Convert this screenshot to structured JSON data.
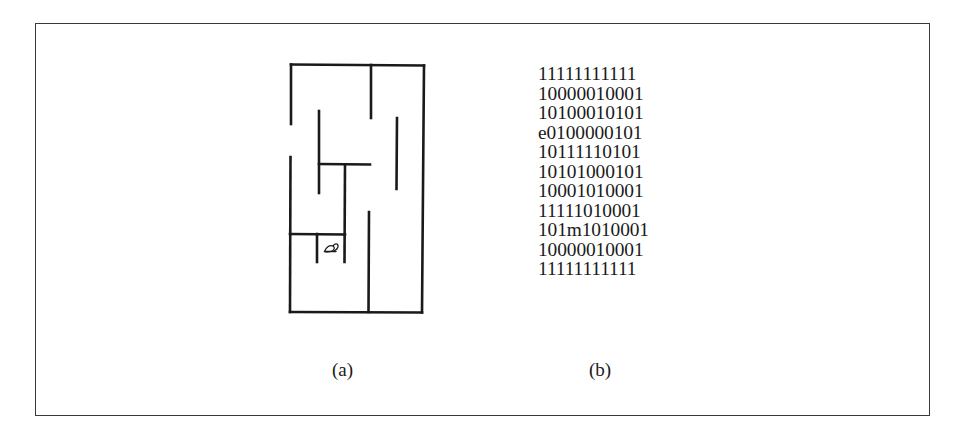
{
  "figure": {
    "panel_a": {
      "caption": "(a)",
      "description": "Maze drawing with a mouse glyph in an enclosed cell",
      "mouse_glyph": "ᘏ",
      "stroke_color": "#1a1a1a"
    },
    "panel_b": {
      "caption": "(b)",
      "description": "Binary grid encoding of the maze; e = entrance, m = mouse",
      "rows": [
        "11111111111",
        "10000010001",
        "10100010101",
        "e0100000101",
        "10111110101",
        "10101000101",
        "10001010001",
        "11111010001",
        "101m1010001",
        "10000010001",
        "11111111111"
      ]
    },
    "frame_color": "#3a3a3a"
  }
}
